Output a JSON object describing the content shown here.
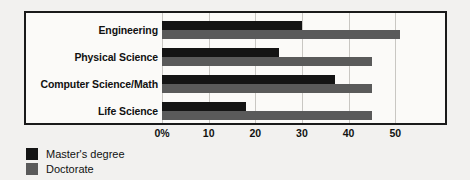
{
  "chart_data": {
    "type": "bar",
    "orientation": "horizontal",
    "title": "",
    "subtitle": "",
    "xlabel": "",
    "ylabel": "",
    "xlim": [
      0,
      60
    ],
    "grid": true,
    "legend_position": "below-left",
    "categories": [
      "Engineering",
      "Physical Science",
      "Computer Science/Math",
      "Life Science"
    ],
    "series": [
      {
        "name": "Master's degree",
        "color": "#141414",
        "values": [
          30,
          25,
          37,
          18
        ]
      },
      {
        "name": "Doctorate",
        "color": "#5a5a5a",
        "values": [
          51,
          45,
          45,
          45
        ]
      }
    ],
    "x_ticks": [
      {
        "value": 0,
        "label": "0%"
      },
      {
        "value": 10,
        "label": "10"
      },
      {
        "value": 20,
        "label": "20"
      },
      {
        "value": 30,
        "label": "30"
      },
      {
        "value": 40,
        "label": "40"
      },
      {
        "value": 50,
        "label": "50"
      }
    ]
  },
  "legend": {
    "items": [
      {
        "label": "Master's degree",
        "swatch": "master"
      },
      {
        "label": "Doctorate",
        "swatch": "doctorate"
      }
    ]
  },
  "colors": {
    "master": "#141414",
    "doctorate": "#5a5a5a",
    "frame": "#1a1a1a",
    "gridline": "#c9c7c3",
    "background": "#f2f1ef",
    "plot_background": "#fbfaf8"
  }
}
